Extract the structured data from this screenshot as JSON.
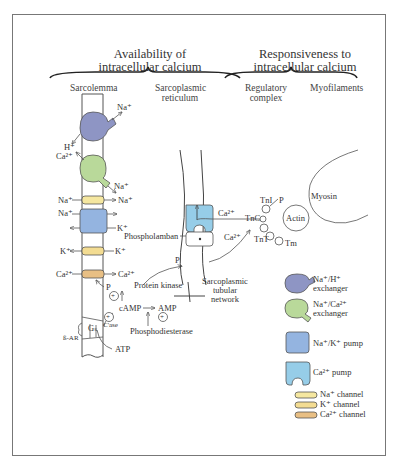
{
  "headings": {
    "availability": [
      "Availability of",
      "intracellular calcium"
    ],
    "responsiveness": [
      "Responsiveness to",
      "intracellular calcium"
    ]
  },
  "subheadings": {
    "sarcolemma": "Sarcolemma",
    "sr": [
      "Sarcoplasmic",
      "reticulum"
    ],
    "regulatory": [
      "Regulatory",
      "complex"
    ],
    "myofilaments": "Myofilaments"
  },
  "membrane_labels": {
    "nah_na": "Na⁺",
    "nah_h": "H⁺",
    "naca_ca": "Ca²⁺",
    "naca_na": "Na⁺",
    "nach_in": "Na⁺",
    "nach_out": "Na⁺",
    "pump_na": "Na⁺",
    "pump_k": "K⁺",
    "kch_out": "K⁺",
    "kch_in": "K⁺",
    "cach_in": "Ca²⁺",
    "cach_out": "Ca²⁺",
    "p_channel": "P",
    "protein_kinase": "Protein kinase",
    "camp": "cAMP",
    "amp": "AMP",
    "phosphodiesterase": "Phosphodiesterase",
    "plus": "+",
    "gs": "Gₛ",
    "cyclase": "C'ase",
    "beta_ar": "ß-AR",
    "atp": "ATP"
  },
  "sr_labels": {
    "phospholamban": "Phospholamban",
    "p": "P",
    "ca_pump": "Ca²⁺",
    "ca_release": "Ca²⁺",
    "tubular": [
      "Sarcoplasmic",
      "tubular",
      "network"
    ]
  },
  "myofilament_labels": {
    "tnc": "TnC",
    "tni": "TnI",
    "tnt": "TnT",
    "tm": "Tm",
    "p": "P",
    "actin": "Actin",
    "myosin": "Myosin"
  },
  "legend": [
    {
      "icon": "na-h-exchanger-icon",
      "label": [
        "Na⁺/H⁺",
        "exchanger"
      ],
      "color": "#8e95c4"
    },
    {
      "icon": "na-ca-exchanger-icon",
      "label": [
        "Na⁺/Ca²⁺",
        "exchanger"
      ],
      "color": "#b9d99a"
    },
    {
      "icon": "na-k-pump-icon",
      "label": [
        "Na⁺/K⁺ pump"
      ],
      "color": "#94b4e0"
    },
    {
      "icon": "ca-pump-icon",
      "label": [
        "Ca²⁺ pump"
      ],
      "color": "#96cde8"
    },
    {
      "icon": "na-channel-icon",
      "label": [
        "Na⁺ channel"
      ],
      "color": "#f5e7a0"
    },
    {
      "icon": "k-channel-icon",
      "label": [
        "K⁺ channel"
      ],
      "color": "#f3dc92"
    },
    {
      "icon": "ca-channel-icon",
      "label": [
        "Ca²⁺ channel"
      ],
      "color": "#e8bf84"
    }
  ],
  "colors": {
    "line": "#444444",
    "na_h": "#8e95c4",
    "na_ca": "#b9d99a",
    "na_k": "#94b4e0",
    "ca_pump": "#96cde8",
    "na_ch": "#f5e7a0",
    "k_ch": "#f3dc92",
    "ca_ch": "#e8bf84"
  }
}
